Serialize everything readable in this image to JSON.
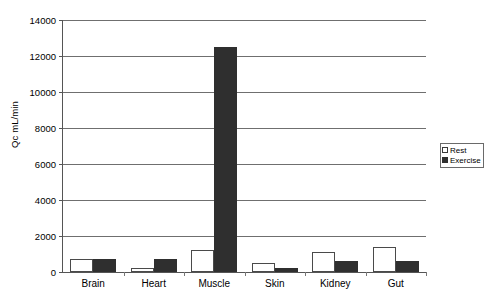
{
  "chart_data": {
    "type": "bar",
    "title": "",
    "xlabel": "",
    "ylabel": "Qc mL/min",
    "ylim": [
      0,
      14000
    ],
    "ytick_step": 2000,
    "yticks": [
      0,
      2000,
      4000,
      6000,
      8000,
      10000,
      12000,
      14000
    ],
    "ytick_labels": [
      "0",
      "2000",
      "4000",
      "6000",
      "8000",
      "10000",
      "12000",
      "14000"
    ],
    "grid": true,
    "legend_position": "right-outside",
    "categories": [
      "Brain",
      "Heart",
      "Muscle",
      "Skin",
      "Kidney",
      "Gut"
    ],
    "series": [
      {
        "name": "Rest",
        "color": "#ffffff",
        "edge_color": "#4a4a4a",
        "values": [
          750,
          250,
          1200,
          500,
          1100,
          1400
        ]
      },
      {
        "name": "Exercise",
        "color": "#2f2f2f",
        "edge_color": "#2f2f2f",
        "values": [
          750,
          750,
          12500,
          200,
          600,
          600
        ]
      }
    ]
  },
  "legend": {
    "items": [
      {
        "label": "Rest",
        "swatch": "hollow-square-icon"
      },
      {
        "label": "Exercise",
        "swatch": "filled-square-icon"
      }
    ]
  }
}
